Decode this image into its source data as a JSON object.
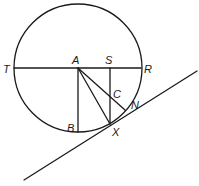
{
  "diagram": {
    "labels": {
      "T": "T",
      "A": "A",
      "S": "S",
      "R": "R",
      "C": "C",
      "N": "N",
      "B": "B",
      "X": "X"
    }
  }
}
